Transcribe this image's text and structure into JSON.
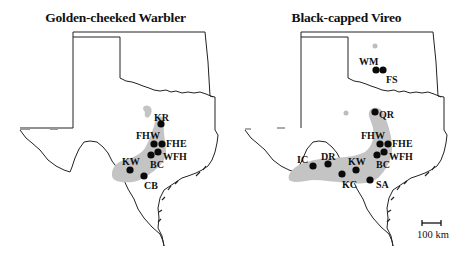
{
  "figure": {
    "panels": [
      {
        "title": "Golden-cheeked Warbler",
        "sites": [
          {
            "code": "KR",
            "x": 161,
            "y": 124,
            "lx": 162,
            "ly": 119,
            "anchor": "start"
          },
          {
            "code": "FHW",
            "x": 154,
            "y": 144,
            "lx": 155,
            "ly": 139,
            "anchor": "end"
          },
          {
            "code": "FHE",
            "x": 162,
            "y": 144,
            "lx": 166,
            "ly": 146,
            "anchor": "start"
          },
          {
            "code": "WFH",
            "x": 158,
            "y": 152,
            "lx": 163,
            "ly": 159,
            "anchor": "start"
          },
          {
            "code": "BC",
            "x": 151,
            "y": 155,
            "lx": 150,
            "ly": 168,
            "anchor": "start"
          },
          {
            "code": "KW",
            "x": 130,
            "y": 170,
            "lx": 122,
            "ly": 165,
            "anchor": "start"
          },
          {
            "code": "CB",
            "x": 144,
            "y": 176,
            "lx": 144,
            "ly": 189,
            "anchor": "start"
          }
        ]
      },
      {
        "title": "Black-capped Vireo",
        "sites": [
          {
            "code": "WM",
            "x": 145,
            "y": 70,
            "lx": 128,
            "ly": 65,
            "anchor": "start"
          },
          {
            "code": "FS",
            "x": 152,
            "y": 70,
            "lx": 155,
            "ly": 83,
            "anchor": "start"
          },
          {
            "code": "QR",
            "x": 144,
            "y": 112,
            "lx": 148,
            "ly": 118,
            "anchor": "start"
          },
          {
            "code": "FHW",
            "x": 149,
            "y": 144,
            "lx": 148,
            "ly": 139,
            "anchor": "end"
          },
          {
            "code": "FHE",
            "x": 157,
            "y": 144,
            "lx": 161,
            "ly": 146,
            "anchor": "start"
          },
          {
            "code": "WFH",
            "x": 153,
            "y": 152,
            "lx": 158,
            "ly": 159,
            "anchor": "start"
          },
          {
            "code": "BC",
            "x": 146,
            "y": 155,
            "lx": 145,
            "ly": 168,
            "anchor": "start"
          },
          {
            "code": "KW",
            "x": 125,
            "y": 170,
            "lx": 117,
            "ly": 165,
            "anchor": "start"
          },
          {
            "code": "DR",
            "x": 97,
            "y": 164,
            "lx": 90,
            "ly": 160,
            "anchor": "start"
          },
          {
            "code": "IC",
            "x": 82,
            "y": 166,
            "lx": 66,
            "ly": 163,
            "anchor": "start"
          },
          {
            "code": "KC",
            "x": 111,
            "y": 174,
            "lx": 111,
            "ly": 188,
            "anchor": "start"
          },
          {
            "code": "SA",
            "x": 139,
            "y": 180,
            "lx": 145,
            "ly": 188,
            "anchor": "start"
          }
        ],
        "outlier_points": [
          {
            "x": 144,
            "y": 46
          },
          {
            "x": 115,
            "y": 112
          }
        ]
      }
    ],
    "scale_bar": {
      "label": "100 km"
    },
    "colors": {
      "range_fill": "#c4c4c4",
      "outline": "#222222",
      "site_dot": "#0a0a0a",
      "outlier_dot": "#bdbdbd"
    }
  }
}
